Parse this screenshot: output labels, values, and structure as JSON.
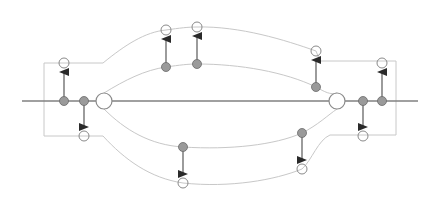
{
  "diagram": {
    "type": "phase-space-orbit-diagram",
    "colors": {
      "background": "#ffffff",
      "axis": "#808080",
      "curve": "#c8c8c8",
      "open_circle": "#8a8a8a",
      "filled_circle": "#9a9a9a",
      "filled_circle_stroke": "#6a6a6a",
      "arrow": "#2a2a2a",
      "arrow_shaft": "#666666"
    },
    "axis": {
      "x1": 22,
      "x2": 418,
      "y": 101
    },
    "big_circles": [
      {
        "id": "left-fixed-point",
        "cx": 104,
        "cy": 101,
        "r": 8
      },
      {
        "id": "right-fixed-point",
        "cx": 337,
        "cy": 101,
        "r": 8
      }
    ],
    "axis_dots": [
      {
        "cx": 64,
        "cy": 101
      },
      {
        "cx": 84,
        "cy": 101
      },
      {
        "cx": 363,
        "cy": 101
      },
      {
        "cx": 382,
        "cy": 101
      }
    ],
    "arrows_up": [
      {
        "x": 64,
        "from": 101,
        "to": 63
      },
      {
        "x": 166,
        "from": 67,
        "to": 30
      },
      {
        "x": 197,
        "from": 64,
        "to": 27
      },
      {
        "x": 316,
        "from": 87,
        "to": 51
      },
      {
        "x": 382,
        "from": 101,
        "to": 63
      }
    ],
    "arrows_down": [
      {
        "x": 84,
        "from": 101,
        "to": 136
      },
      {
        "x": 183,
        "from": 147,
        "to": 183
      },
      {
        "x": 302,
        "from": 133,
        "to": 169
      },
      {
        "x": 363,
        "from": 101,
        "to": 136
      }
    ]
  }
}
